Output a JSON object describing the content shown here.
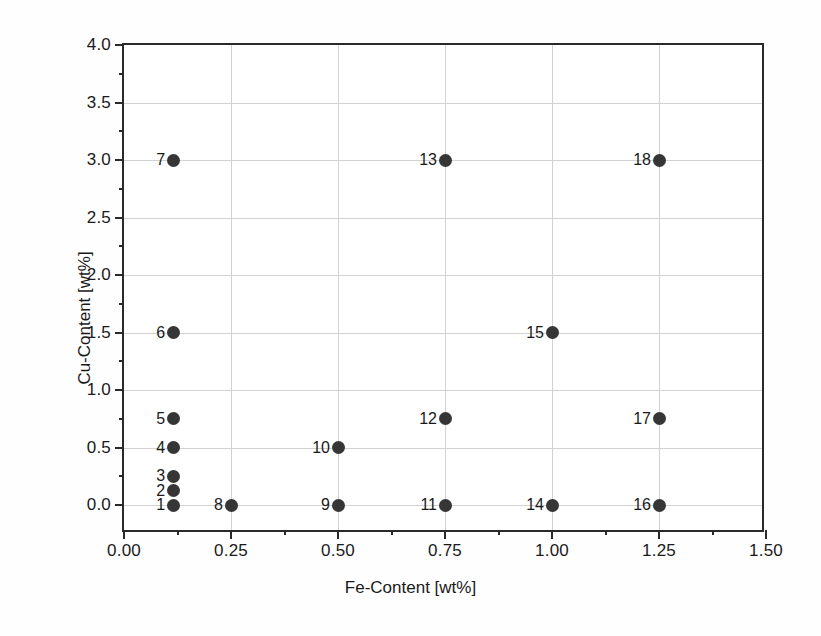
{
  "chart_data": {
    "type": "scatter",
    "title": "",
    "xlabel": "Fe-Content [wt%]",
    "ylabel": "Cu-Content [wt%]",
    "xlim": [
      0.0,
      1.5
    ],
    "ylim": [
      -0.25,
      4.0
    ],
    "xticks": [
      0.0,
      0.25,
      0.5,
      0.75,
      1.0,
      1.25,
      1.5
    ],
    "xticklabels": [
      "0.00",
      "0.25",
      "0.50",
      "0.75",
      "1.00",
      "1.25",
      "1.50"
    ],
    "xminorticks": [
      0.125,
      0.375,
      0.625,
      0.875,
      1.125,
      1.375
    ],
    "yticks": [
      0.0,
      0.5,
      1.0,
      1.5,
      2.0,
      2.5,
      3.0,
      3.5,
      4.0
    ],
    "yticklabels": [
      "0.0",
      "0.5",
      "1.0",
      "1.5",
      "2.0",
      "2.5",
      "3.0",
      "3.5",
      "4.0"
    ],
    "yminorticks": [
      0.25,
      0.75,
      1.25,
      1.75,
      2.25,
      2.75,
      3.25,
      3.75
    ],
    "grid": true,
    "grid_color": "#d2d2d2",
    "marker_color": "#363636",
    "frame_color": "#2a2a2a",
    "legend": null,
    "points": [
      {
        "label": "1",
        "x": 0.115,
        "y": 0.0
      },
      {
        "label": "2",
        "x": 0.115,
        "y": 0.125
      },
      {
        "label": "3",
        "x": 0.115,
        "y": 0.25
      },
      {
        "label": "4",
        "x": 0.115,
        "y": 0.5
      },
      {
        "label": "5",
        "x": 0.115,
        "y": 0.75
      },
      {
        "label": "6",
        "x": 0.115,
        "y": 1.5
      },
      {
        "label": "7",
        "x": 0.115,
        "y": 3.0
      },
      {
        "label": "8",
        "x": 0.25,
        "y": 0.0
      },
      {
        "label": "9",
        "x": 0.5,
        "y": 0.0
      },
      {
        "label": "10",
        "x": 0.5,
        "y": 0.5
      },
      {
        "label": "11",
        "x": 0.75,
        "y": 0.0
      },
      {
        "label": "12",
        "x": 0.75,
        "y": 0.75
      },
      {
        "label": "13",
        "x": 0.75,
        "y": 3.0
      },
      {
        "label": "14",
        "x": 1.0,
        "y": 0.0
      },
      {
        "label": "15",
        "x": 1.0,
        "y": 1.5
      },
      {
        "label": "16",
        "x": 1.25,
        "y": 0.0
      },
      {
        "label": "17",
        "x": 1.25,
        "y": 0.75
      },
      {
        "label": "18",
        "x": 1.25,
        "y": 3.0
      }
    ]
  }
}
